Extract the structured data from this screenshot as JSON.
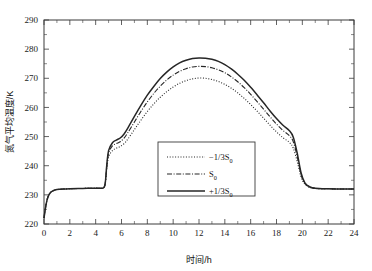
{
  "chart_data": {
    "type": "line",
    "title": "",
    "xlabel": "时间/h",
    "ylabel": "氮气平均温度/K",
    "xlim": [
      0,
      24
    ],
    "ylim": [
      220,
      290
    ],
    "xticks": [
      0,
      2,
      4,
      6,
      8,
      10,
      12,
      14,
      16,
      18,
      20,
      22,
      24
    ],
    "yticks": [
      220,
      230,
      240,
      250,
      260,
      270,
      280,
      290
    ],
    "grid": false,
    "legend_position": "center",
    "series": [
      {
        "name": "-1/3S<sub>0</sub>",
        "label_main": "−1/3S",
        "label_sub": "0",
        "style": "dotted",
        "color": "#262626",
        "x": [
          0,
          0.15,
          0.3,
          0.5,
          0.75,
          1.0,
          1.5,
          2.0,
          3.0,
          4.0,
          4.6,
          4.75,
          4.85,
          5.0,
          5.3,
          5.6,
          5.9,
          6.2,
          6.5,
          7.0,
          7.5,
          8.0,
          8.5,
          9.0,
          9.5,
          10.0,
          10.5,
          11.0,
          11.5,
          12.0,
          12.5,
          13.0,
          13.5,
          14.0,
          14.5,
          15.0,
          15.5,
          16.0,
          16.5,
          17.0,
          17.5,
          18.0,
          18.5,
          19.0,
          19.3,
          19.6,
          19.9,
          20.2,
          20.6,
          21.0,
          22.0,
          23.0,
          24.0
        ],
        "y": [
          222.0,
          226.5,
          229.2,
          230.8,
          231.5,
          231.8,
          232.0,
          232.1,
          232.2,
          232.3,
          232.4,
          234.0,
          238.5,
          243.0,
          245.2,
          246.0,
          246.6,
          247.6,
          249.2,
          252.4,
          255.6,
          258.6,
          261.2,
          263.5,
          265.4,
          267.0,
          268.3,
          269.2,
          269.8,
          270.1,
          270.0,
          269.6,
          268.9,
          267.9,
          266.6,
          265.0,
          263.1,
          261.0,
          258.7,
          256.3,
          253.9,
          251.6,
          249.6,
          248.0,
          246.0,
          241.5,
          236.2,
          233.6,
          232.5,
          232.2,
          232.1,
          232.0,
          232.0
        ]
      },
      {
        "name": "S<sub>0</sub>",
        "label_main": "S",
        "label_sub": "0",
        "style": "dash-dot",
        "color": "#262626",
        "x": [
          0,
          0.15,
          0.3,
          0.5,
          0.75,
          1.0,
          1.5,
          2.0,
          3.0,
          4.0,
          4.6,
          4.75,
          4.85,
          5.0,
          5.3,
          5.6,
          5.9,
          6.2,
          6.5,
          7.0,
          7.5,
          8.0,
          8.5,
          9.0,
          9.5,
          10.0,
          10.5,
          11.0,
          11.5,
          12.0,
          12.5,
          13.0,
          13.5,
          14.0,
          14.5,
          15.0,
          15.5,
          16.0,
          16.5,
          17.0,
          17.5,
          18.0,
          18.5,
          19.0,
          19.3,
          19.6,
          19.9,
          20.2,
          20.6,
          21.0,
          22.0,
          23.0,
          24.0
        ],
        "y": [
          222.0,
          226.5,
          229.2,
          230.8,
          231.5,
          231.8,
          232.0,
          232.1,
          232.2,
          232.3,
          232.4,
          234.2,
          239.2,
          244.3,
          246.8,
          247.6,
          248.2,
          249.5,
          251.4,
          255.0,
          258.6,
          261.9,
          264.8,
          267.3,
          269.4,
          271.1,
          272.4,
          273.3,
          273.9,
          274.1,
          274.0,
          273.6,
          272.9,
          271.9,
          270.5,
          268.8,
          266.8,
          264.5,
          262.0,
          259.4,
          256.8,
          254.3,
          252.1,
          250.3,
          248.2,
          243.2,
          237.0,
          233.9,
          232.6,
          232.2,
          232.1,
          232.0,
          232.0
        ]
      },
      {
        "name": "+1/3S<sub>0</sub>",
        "label_main": "+1/3S",
        "label_sub": "0",
        "style": "solid",
        "color": "#262626",
        "x": [
          0,
          0.15,
          0.3,
          0.5,
          0.75,
          1.0,
          1.5,
          2.0,
          3.0,
          4.0,
          4.6,
          4.75,
          4.85,
          5.0,
          5.3,
          5.6,
          5.9,
          6.2,
          6.5,
          7.0,
          7.5,
          8.0,
          8.5,
          9.0,
          9.5,
          10.0,
          10.5,
          11.0,
          11.5,
          12.0,
          12.5,
          13.0,
          13.5,
          14.0,
          14.5,
          15.0,
          15.5,
          16.0,
          16.5,
          17.0,
          17.5,
          18.0,
          18.5,
          19.0,
          19.3,
          19.6,
          19.9,
          20.2,
          20.6,
          21.0,
          22.0,
          23.0,
          24.0
        ],
        "y": [
          222.0,
          226.5,
          229.2,
          230.8,
          231.5,
          231.8,
          232.0,
          232.1,
          232.2,
          232.3,
          232.4,
          234.4,
          239.8,
          245.2,
          247.9,
          248.8,
          249.5,
          250.9,
          253.0,
          256.9,
          260.7,
          264.2,
          267.2,
          269.9,
          272.1,
          273.9,
          275.3,
          276.2,
          276.8,
          277.0,
          276.9,
          276.5,
          275.8,
          274.7,
          273.2,
          271.4,
          269.3,
          266.9,
          264.3,
          261.6,
          258.8,
          256.2,
          253.9,
          252.0,
          249.8,
          244.4,
          237.6,
          234.1,
          232.7,
          232.3,
          232.1,
          232.0,
          232.0
        ]
      }
    ]
  },
  "legend": {
    "entries": [
      {
        "text_main": "−1/3S",
        "text_sub": "0",
        "style": "dotted"
      },
      {
        "text_main": "S",
        "text_sub": "0",
        "style": "dash-dot"
      },
      {
        "text_main": "+1/3S",
        "text_sub": "0",
        "style": "solid"
      }
    ]
  },
  "axes": {
    "y_label": "氮气平均温度/K",
    "x_label": "时间/h",
    "y_ticks": [
      "220",
      "230",
      "240",
      "250",
      "260",
      "270",
      "280",
      "290"
    ],
    "x_ticks": [
      "0",
      "2",
      "4",
      "6",
      "8",
      "10",
      "12",
      "14",
      "16",
      "18",
      "20",
      "22",
      "24"
    ]
  },
  "colors": {
    "curve": "#262626",
    "axis": "#3a3a3a",
    "background": "#ffffff"
  }
}
